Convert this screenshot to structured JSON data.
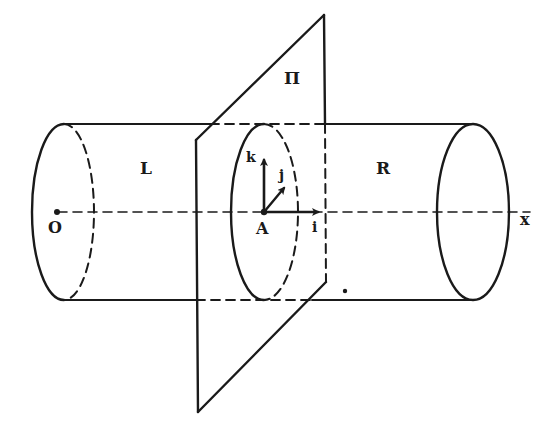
{
  "diagram": {
    "colors": {
      "ink": "#1a1a1a",
      "background": "#ffffff"
    },
    "labels": {
      "plane": "Π",
      "left_part": "L",
      "right_part": "R",
      "origin": "O",
      "point": "A",
      "axis": "x",
      "vec_i": "i",
      "vec_j": "j",
      "vec_k": "k"
    },
    "elements": [
      {
        "name": "cylinder",
        "shape": "cylinder",
        "axis": "x"
      },
      {
        "name": "cutting-plane",
        "label": "Π"
      },
      {
        "name": "frame-at-A",
        "vectors": [
          "i",
          "j",
          "k"
        ]
      }
    ]
  }
}
